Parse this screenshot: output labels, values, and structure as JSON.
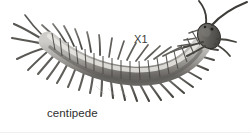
{
  "figure": {
    "caption": "centipede",
    "scale_label": "X1",
    "subject": "centipede",
    "style": "grayscale-line-illustration",
    "background_color": "#ffffff",
    "ink_color": "#3c3c3c",
    "body_fill_light": "#d8d6d2",
    "body_fill_mid": "#a8a6a2",
    "body_fill_dark": "#6e6c69",
    "head_color": "#55534f",
    "anatomy": {
      "head": "head",
      "antennae": "antennae",
      "body_segments": "body-segments",
      "legs": "legs",
      "terminal_appendages": "terminal-appendages"
    }
  }
}
